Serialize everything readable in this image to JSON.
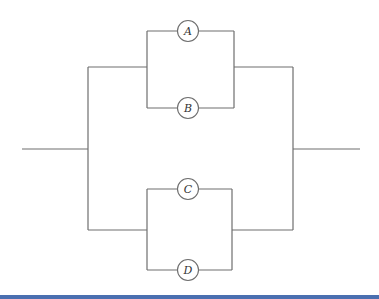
{
  "diagram": {
    "type": "parallel-series reliability block diagram",
    "components": [
      {
        "id": "A",
        "label": "A",
        "cx": 188,
        "cy": 31
      },
      {
        "id": "B",
        "label": "B",
        "cx": 188,
        "cy": 108
      },
      {
        "id": "C",
        "label": "C",
        "cx": 188,
        "cy": 189
      },
      {
        "id": "D",
        "label": "D",
        "cx": 188,
        "cy": 270
      }
    ],
    "groups": [
      {
        "name": "upper-parallel",
        "members": [
          "A",
          "B"
        ]
      },
      {
        "name": "lower-parallel",
        "members": [
          "C",
          "D"
        ]
      }
    ],
    "colors": {
      "line": "#6e6e6e",
      "bottom_bar": "#4a6fb0"
    }
  }
}
